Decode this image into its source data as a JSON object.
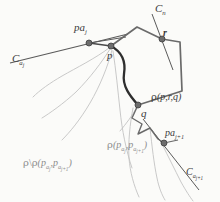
{
  "figure": {
    "background_color": "#fbfbf9",
    "ink_color": "#4a4a4a",
    "faint_color": "#b9b9b9",
    "node_color": "#6d6d6d"
  },
  "labels": {
    "pa_j": {
      "base": "pa",
      "sub": "j",
      "text": "pa_j"
    },
    "p": {
      "text": "p"
    },
    "c_aj": {
      "base": "C",
      "sub": "a",
      "sub2": "j",
      "text": "C_a_j"
    },
    "c_n": {
      "base": "C",
      "sub": "n",
      "text": "C_n"
    },
    "r": {
      "text": "r"
    },
    "q": {
      "text": "q"
    },
    "rho_prq": {
      "rho": "ρ",
      "args": "(p,r,q)",
      "text": "rho(p,r,q)"
    },
    "rho_papa": {
      "rho": "ρ",
      "open": "(p",
      "s1": "a",
      "s1b": "j",
      "mid": ",p",
      "s2": "a",
      "s2b": "j+1",
      "close": ")",
      "text": "rho(pa_j, pa_j+1)"
    },
    "rho_diff": {
      "rho": "ρ",
      "bslash": "\\",
      "rho2": "ρ",
      "open": "(p",
      "s1": "a",
      "s1b": "j",
      "mid": ",p",
      "s2": "a",
      "s2b": "j+1",
      "close": ")",
      "text": "rho \\ rho(pa_j, pa_j+1)"
    },
    "pa_j1": {
      "base": "pa",
      "sub": "j+1",
      "text": "pa_j+1"
    },
    "c_aj1": {
      "base": "C",
      "sub": "a",
      "sub2": "j+1",
      "text": "C_a_j+1"
    }
  },
  "nodes": [
    {
      "name": "pa_j",
      "x": 89,
      "y": 43
    },
    {
      "name": "p",
      "x": 111,
      "y": 46
    },
    {
      "name": "r",
      "x": 162,
      "y": 39
    },
    {
      "name": "q",
      "x": 138,
      "y": 105
    },
    {
      "name": "pa_j+1",
      "x": 164,
      "y": 143
    }
  ]
}
